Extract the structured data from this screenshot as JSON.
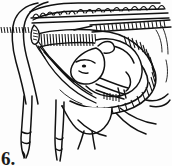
{
  "figure": {
    "number_label": "6.",
    "caption": "",
    "style": "black ink line drawing, hatched shading, white background",
    "domain_subject": "veterinary obstetrics anatomical illustration"
  },
  "colors": {
    "ink": "#111111",
    "background": "#fdfdfd",
    "hatch": "#1a1a1a",
    "fill_white": "#ffffff"
  },
  "structures": [
    {
      "name": "vertebral-column",
      "label": "",
      "position": "top"
    },
    {
      "name": "spinous-processes",
      "label": "",
      "position": "top"
    },
    {
      "name": "uterine-wall-hatched-band",
      "label": "",
      "position": "upper-middle"
    },
    {
      "name": "fetus-body",
      "label": "",
      "position": "center-right"
    },
    {
      "name": "fetus-head",
      "label": "",
      "position": "center"
    },
    {
      "name": "fetus-forelimbs",
      "label": "",
      "position": "center-lower"
    },
    {
      "name": "pelvic-floor",
      "label": "",
      "position": "lower-right"
    },
    {
      "name": "maternal-forelimb-left",
      "label": "",
      "position": "lower-left"
    },
    {
      "name": "maternal-forelimb-right",
      "label": "",
      "position": "lower-left"
    },
    {
      "name": "udder-outline",
      "label": "",
      "position": "bottom-center"
    },
    {
      "name": "neck-outline",
      "label": "",
      "position": "left"
    }
  ]
}
